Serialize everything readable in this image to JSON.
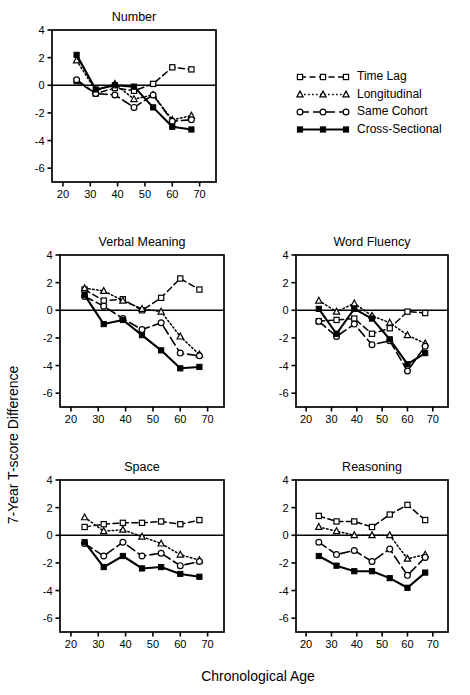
{
  "figure": {
    "xlabel": "Chronological Age",
    "ylabel": "7-Year T-score Difference"
  },
  "legend": {
    "items": [
      {
        "label": "Time Lag",
        "marker": "open-square",
        "dash": "dashed",
        "key": "time_lag"
      },
      {
        "label": "Longitudinal",
        "marker": "open-triangle",
        "dash": "dotted",
        "key": "longitudinal"
      },
      {
        "label": "Same Cohort",
        "marker": "open-circle",
        "dash": "long-dash",
        "key": "same_cohort"
      },
      {
        "label": "Cross-Sectional",
        "marker": "filled-square",
        "dash": "solid",
        "key": "cross_sectional"
      }
    ]
  },
  "chart_data": [
    {
      "type": "line",
      "title": "Number",
      "xlabel": "Chronological Age",
      "ylabel": "7-Year T-score Difference",
      "xlim": [
        16,
        76
      ],
      "ylim": [
        -7,
        4
      ],
      "xticks": [
        20,
        30,
        40,
        50,
        60,
        70
      ],
      "yticks": [
        4,
        2,
        0,
        -2,
        -4,
        -6
      ],
      "grid": false,
      "legend_position": "outside-right",
      "x": [
        25,
        32,
        39,
        46,
        53,
        60,
        67
      ],
      "series": [
        {
          "name": "Time Lag",
          "values": [
            0.3,
            -0.6,
            -0.2,
            -0.4,
            0.1,
            1.3,
            1.15
          ]
        },
        {
          "name": "Longitudinal",
          "values": [
            1.8,
            -0.4,
            0.1,
            -1.0,
            -0.7,
            -2.5,
            -2.2
          ]
        },
        {
          "name": "Same Cohort",
          "values": [
            0.4,
            -0.6,
            -0.7,
            -1.6,
            -0.7,
            -2.6,
            -2.5
          ]
        },
        {
          "name": "Cross-Sectional",
          "values": [
            2.2,
            -0.3,
            0.0,
            -0.1,
            -1.6,
            -3.0,
            -3.2
          ]
        }
      ]
    },
    {
      "type": "line",
      "title": "Verbal Meaning",
      "xlabel": "Chronological Age",
      "ylabel": "7-Year T-score Difference",
      "xlim": [
        16,
        76
      ],
      "ylim": [
        -7,
        4
      ],
      "xticks": [
        20,
        30,
        40,
        50,
        60,
        70
      ],
      "yticks": [
        4,
        2,
        0,
        -2,
        -4,
        -6
      ],
      "grid": false,
      "legend_position": "outside-right",
      "x": [
        25,
        32,
        39,
        46,
        53,
        60,
        67
      ],
      "series": [
        {
          "name": "Time Lag",
          "values": [
            1.5,
            0.7,
            0.8,
            0.0,
            0.9,
            2.3,
            1.5
          ]
        },
        {
          "name": "Longitudinal",
          "values": [
            1.6,
            1.4,
            0.7,
            0.1,
            -0.1,
            -1.9,
            -3.2
          ]
        },
        {
          "name": "Same Cohort",
          "values": [
            1.0,
            0.3,
            -0.6,
            -1.4,
            -0.9,
            -3.1,
            -3.3
          ]
        },
        {
          "name": "Cross-Sectional",
          "values": [
            1.1,
            -1.0,
            -0.7,
            -1.8,
            -2.9,
            -4.2,
            -4.1
          ]
        }
      ]
    },
    {
      "type": "line",
      "title": "Word Fluency",
      "xlabel": "Chronological Age",
      "ylabel": "7-Year T-score Difference",
      "xlim": [
        16,
        76
      ],
      "ylim": [
        -7,
        4
      ],
      "xticks": [
        20,
        30,
        40,
        50,
        60,
        70
      ],
      "yticks": [
        4,
        2,
        0,
        -2,
        -4,
        -6
      ],
      "grid": false,
      "legend_position": "outside-right",
      "x": [
        25,
        32,
        39,
        46,
        53,
        60,
        67
      ],
      "series": [
        {
          "name": "Time Lag",
          "values": [
            -0.8,
            -0.7,
            -0.6,
            -1.7,
            -1.3,
            -0.1,
            -0.2
          ]
        },
        {
          "name": "Longitudinal",
          "values": [
            0.7,
            -0.1,
            0.5,
            -0.4,
            -0.9,
            -1.8,
            -2.4
          ]
        },
        {
          "name": "Same Cohort",
          "values": [
            -0.8,
            -1.9,
            -1.0,
            -2.5,
            -2.2,
            -4.4,
            -2.6
          ]
        },
        {
          "name": "Cross-Sectional",
          "values": [
            0.1,
            -1.7,
            0.1,
            -0.6,
            -2.1,
            -3.9,
            -3.1
          ]
        }
      ]
    },
    {
      "type": "line",
      "title": "Space",
      "xlabel": "Chronological Age",
      "ylabel": "7-Year T-score Difference",
      "xlim": [
        16,
        76
      ],
      "ylim": [
        -7,
        4
      ],
      "xticks": [
        20,
        30,
        40,
        50,
        60,
        70
      ],
      "yticks": [
        4,
        2,
        0,
        -2,
        -4,
        -6
      ],
      "grid": false,
      "legend_position": "outside-right",
      "x": [
        25,
        32,
        39,
        46,
        53,
        60,
        67
      ],
      "series": [
        {
          "name": "Time Lag",
          "values": [
            0.6,
            0.8,
            0.9,
            0.9,
            1.0,
            0.8,
            1.1
          ]
        },
        {
          "name": "Longitudinal",
          "values": [
            1.3,
            0.3,
            0.4,
            -0.1,
            -0.6,
            -1.4,
            -1.8
          ]
        },
        {
          "name": "Same Cohort",
          "values": [
            -0.6,
            -1.5,
            -0.5,
            -1.5,
            -1.3,
            -2.2,
            -1.9
          ]
        },
        {
          "name": "Cross-Sectional",
          "values": [
            -0.5,
            -2.3,
            -1.5,
            -2.4,
            -2.3,
            -2.8,
            -3.0
          ]
        }
      ]
    },
    {
      "type": "line",
      "title": "Reasoning",
      "xlabel": "Chronological Age",
      "ylabel": "7-Year T-score Difference",
      "xlim": [
        16,
        76
      ],
      "ylim": [
        -7,
        4
      ],
      "xticks": [
        20,
        30,
        40,
        50,
        60,
        70
      ],
      "yticks": [
        4,
        2,
        0,
        -2,
        -4,
        -6
      ],
      "grid": false,
      "legend_position": "outside-right",
      "x": [
        25,
        32,
        39,
        46,
        53,
        60,
        67
      ],
      "series": [
        {
          "name": "Time Lag",
          "values": [
            1.4,
            1.0,
            1.0,
            0.6,
            1.5,
            2.2,
            1.1
          ]
        },
        {
          "name": "Longitudinal",
          "values": [
            0.6,
            0.3,
            0.0,
            0.0,
            0.0,
            -1.7,
            -1.4
          ]
        },
        {
          "name": "Same Cohort",
          "values": [
            -0.5,
            -1.4,
            -1.1,
            -1.9,
            -1.0,
            -2.9,
            -1.6
          ]
        },
        {
          "name": "Cross-Sectional",
          "values": [
            -1.5,
            -2.2,
            -2.6,
            -2.6,
            -3.1,
            -3.8,
            -2.7
          ]
        }
      ]
    }
  ]
}
